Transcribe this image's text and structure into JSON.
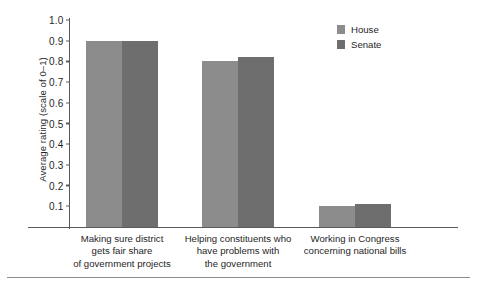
{
  "chart_data": {
    "type": "bar",
    "title": "",
    "xlabel": "",
    "ylabel": "Average rating (scale of 0–1)",
    "ylim": [
      0,
      1.0
    ],
    "grid": false,
    "legend_position": "top-right",
    "categories": [
      "Making sure district gets fair share of government projects",
      "Helping constituents who have problems with the government",
      "Working in Congress concerning national bills"
    ],
    "category_lines": [
      [
        "Making sure district",
        "gets fair share",
        "of government projects"
      ],
      [
        "Helping constituents who",
        "have problems with",
        "the government"
      ],
      [
        "Working in Congress",
        "concerning national bills"
      ]
    ],
    "series": [
      {
        "name": "House",
        "color": "#8c8c8c",
        "values": [
          0.9,
          0.8,
          0.1
        ]
      },
      {
        "name": "Senate",
        "color": "#6e6e6e",
        "values": [
          0.9,
          0.82,
          0.11
        ]
      }
    ],
    "yticks": [
      "1.0",
      "0.9",
      "0.8",
      "0.7",
      "0.6",
      "0.5",
      "0.4",
      "0.3",
      "0.2",
      "0.1"
    ],
    "ytick_values": [
      1.0,
      0.9,
      0.8,
      0.7,
      0.6,
      0.5,
      0.4,
      0.3,
      0.2,
      0.1
    ]
  },
  "legend": {
    "items": [
      {
        "label": "House"
      },
      {
        "label": "Senate"
      }
    ]
  }
}
